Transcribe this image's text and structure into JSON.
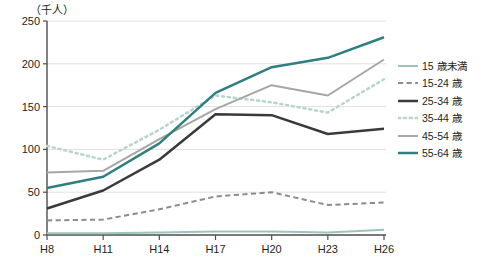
{
  "chart_data": {
    "type": "line",
    "title": "（千人）",
    "unit_label": "（千人）",
    "xlabel": "",
    "ylabel": "",
    "categories": [
      "H8",
      "H11",
      "H14",
      "H17",
      "H20",
      "H23",
      "H26"
    ],
    "ylim": [
      0,
      250
    ],
    "yticks": [
      0,
      50,
      100,
      150,
      200,
      250
    ],
    "grid": true,
    "legend_position": "right",
    "series": [
      {
        "name": "15 歳未満",
        "values": [
          2,
          2,
          3,
          4,
          4,
          3,
          6
        ],
        "color": "#9dc3bd",
        "style": "solid",
        "width": 2
      },
      {
        "name": "15-24 歳",
        "values": [
          17,
          18,
          30,
          45,
          50,
          35,
          38
        ],
        "color": "#8c8c8c",
        "style": "dashed",
        "width": 2
      },
      {
        "name": "25-34 歳",
        "values": [
          31,
          52,
          88,
          141,
          140,
          118,
          124
        ],
        "color": "#3a3a3a",
        "style": "solid",
        "width": 2.5
      },
      {
        "name": "35-44 歳",
        "values": [
          104,
          88,
          123,
          163,
          155,
          143,
          182
        ],
        "color": "#b7d4cf",
        "style": "dotted",
        "width": 2.5
      },
      {
        "name": "45-54 歳",
        "values": [
          73,
          75,
          112,
          147,
          175,
          163,
          205
        ],
        "color": "#a6a6a6",
        "style": "solid",
        "width": 2
      },
      {
        "name": "55-64 歳",
        "values": [
          55,
          68,
          107,
          166,
          196,
          207,
          231
        ],
        "color": "#2f7f7f",
        "style": "solid",
        "width": 2.5
      }
    ]
  }
}
